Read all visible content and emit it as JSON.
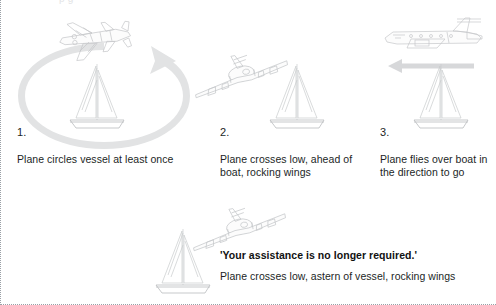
{
  "page": {
    "cutoff_top_text": "p g",
    "background_color": "#ffffff",
    "border_style": "dotted",
    "border_color": "#9aa0a6"
  },
  "panels": [
    {
      "number": "1.",
      "caption": "Plane circles vessel at least once",
      "icons": [
        "airplane-top-view-icon",
        "circular-arrow-icon",
        "sailboat-icon"
      ]
    },
    {
      "number": "2.",
      "caption": "Plane crosses low, ahead of boat, rocking wings",
      "icons": [
        "airplane-front-banking-icon",
        "sailboat-icon"
      ]
    },
    {
      "number": "3.",
      "caption": "Plane flies over boat in the direction to go",
      "icons": [
        "airplane-side-view-icon",
        "left-arrow-icon",
        "sailboat-icon"
      ]
    }
  ],
  "footer": {
    "quote": "'Your assistance is no longer required.'",
    "caption": "Plane crosses low, astern of vessel, rocking wings",
    "icons": [
      "airplane-front-banking-icon",
      "sailboat-icon"
    ]
  }
}
